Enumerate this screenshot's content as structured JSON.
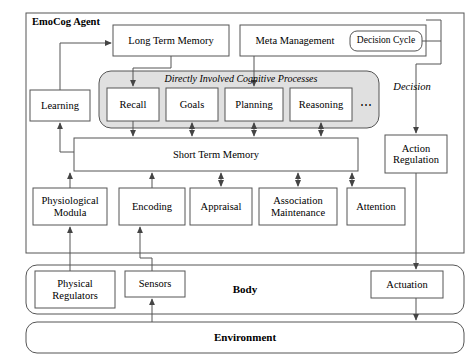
{
  "diagram": {
    "type": "block-diagram",
    "colors": {
      "panel_fill": "#e0e0e0",
      "box_fill": "#ffffff",
      "stroke": "#555555",
      "text": "#000000"
    },
    "frames": {
      "agent": {
        "label": "EmoCog Agent",
        "bold": true,
        "x": 26,
        "y": 13,
        "w": 438,
        "h": 240
      },
      "body": {
        "label": "Body",
        "bold": true,
        "x": 26,
        "y": 265,
        "w": 438,
        "h": 49,
        "rounded": true
      },
      "environment": {
        "label": "Environment",
        "bold": true,
        "x": 26,
        "y": 322,
        "w": 438,
        "h": 31,
        "rounded": true
      }
    },
    "cognitive_panel": {
      "label": "Directly Involved Cognitive Processes",
      "italic": true,
      "x": 99,
      "y": 71,
      "w": 280,
      "h": 57,
      "ellipsis": "⋯",
      "processes": [
        {
          "label": "Recall",
          "x": 107,
          "y": 88,
          "w": 52,
          "h": 33
        },
        {
          "label": "Goals",
          "x": 166,
          "y": 88,
          "w": 52,
          "h": 33
        },
        {
          "label": "Planning",
          "x": 225,
          "y": 88,
          "w": 58,
          "h": 33
        },
        {
          "label": "Reasoning",
          "x": 290,
          "y": 88,
          "w": 62,
          "h": 33
        }
      ]
    },
    "boxes": [
      {
        "name": "long-term-memory",
        "label": "Long Term Memory",
        "x": 113,
        "y": 25,
        "w": 116,
        "h": 31
      },
      {
        "name": "meta-management",
        "label": "Meta Management",
        "x": 240,
        "y": 25,
        "w": 186,
        "h": 31
      },
      {
        "name": "decision-cycle",
        "label": "Decision Cycle",
        "x": 350,
        "y": 31,
        "w": 72,
        "h": 20,
        "rounded": true
      },
      {
        "name": "learning",
        "label": "Learning",
        "x": 30,
        "y": 90,
        "w": 60,
        "h": 31
      },
      {
        "name": "short-term-memory",
        "label": "Short Term Memory",
        "x": 74,
        "y": 138,
        "w": 284,
        "h": 33
      },
      {
        "name": "action-regulation",
        "label": "Action Regulation",
        "x": 385,
        "y": 135,
        "w": 62,
        "h": 38
      },
      {
        "name": "physiological-modula",
        "label": "Physiological Modula",
        "x": 33,
        "y": 188,
        "w": 74,
        "h": 37
      },
      {
        "name": "encoding",
        "label": "Encoding",
        "x": 119,
        "y": 188,
        "w": 66,
        "h": 37
      },
      {
        "name": "appraisal",
        "label": "Appraisal",
        "x": 190,
        "y": 188,
        "w": 62,
        "h": 37
      },
      {
        "name": "association-maintenance",
        "label": "Association Maintenance",
        "x": 259,
        "y": 188,
        "w": 78,
        "h": 37
      },
      {
        "name": "attention",
        "label": "Attention",
        "x": 347,
        "y": 188,
        "w": 58,
        "h": 37
      },
      {
        "name": "physical-regulators",
        "label": "Physical Regulators",
        "x": 35,
        "y": 271,
        "w": 80,
        "h": 37
      },
      {
        "name": "sensors",
        "label": "Sensors",
        "x": 125,
        "y": 271,
        "w": 60,
        "h": 26
      },
      {
        "name": "actuation",
        "label": "Actuation",
        "x": 371,
        "y": 271,
        "w": 72,
        "h": 27
      }
    ],
    "annotations": [
      {
        "name": "decision-label",
        "label": "Decision",
        "italic": true,
        "x": 382,
        "y": 82,
        "w": 60,
        "h": 14
      }
    ]
  }
}
